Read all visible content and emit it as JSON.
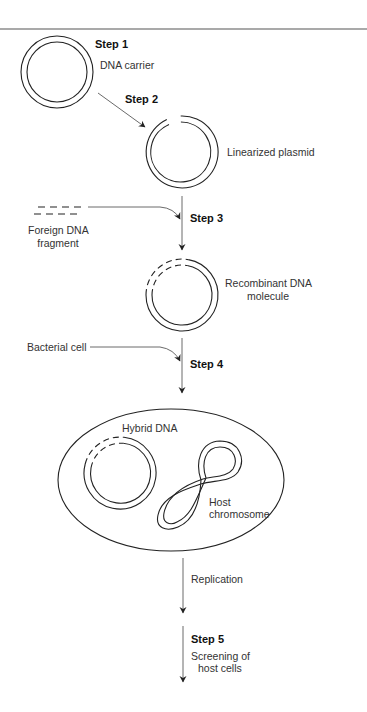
{
  "diagram": {
    "type": "process-flow",
    "steps": [
      {
        "id": "step1",
        "label": "Step 1",
        "description": "DNA carrier"
      },
      {
        "id": "step2",
        "label": "Step 2",
        "description": "Linearized plasmid"
      },
      {
        "id": "step3",
        "label": "Step 3",
        "input": "Foreign DNA fragment",
        "description": "Recombinant DNA molecule"
      },
      {
        "id": "step4",
        "label": "Step 4",
        "input": "Bacterial cell"
      },
      {
        "id": "step5",
        "label": "Step 5",
        "description": "Screening of host cells"
      }
    ],
    "labels": {
      "step1": "Step 1",
      "dna_carrier": "DNA carrier",
      "step2": "Step 2",
      "linearized_plasmid": "Linearized plasmid",
      "foreign_dna_line1": "Foreign DNA",
      "foreign_dna_line2": "fragment",
      "step3": "Step 3",
      "recombinant_line1": "Recombinant DNA",
      "recombinant_line2": "molecule",
      "bacterial_cell": "Bacterial cell",
      "step4": "Step 4",
      "hybrid_dna": "Hybrid DNA",
      "host_line1": "Host",
      "host_line2": "chromosome",
      "replication": "Replication",
      "step5": "Step 5",
      "screening_line1": "Screening of",
      "screening_line2": "host cells"
    },
    "edges": [
      {
        "from": "DNA carrier",
        "to": "Linearized plasmid",
        "label": "Step 2"
      },
      {
        "from": "Linearized plasmid",
        "to": "Recombinant DNA molecule",
        "label": "Step 3"
      },
      {
        "from": "Foreign DNA fragment",
        "to": "Recombinant DNA molecule",
        "label": "Step 3"
      },
      {
        "from": "Recombinant DNA molecule",
        "to": "Bacterial cell",
        "label": "Step 4"
      },
      {
        "from": "Bacterial cell",
        "to": "Replicated host cells",
        "label": "Replication"
      },
      {
        "from": "Replicated host cells",
        "to": "Screening",
        "label": "Step 5"
      }
    ]
  }
}
